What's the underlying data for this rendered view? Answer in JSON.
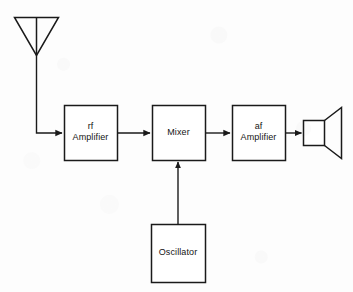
{
  "diagram": {
    "stroke_color": "#1a1a1a",
    "background_color": "#fdfdfd",
    "blocks": [
      {
        "id": "rf-amplifier",
        "label": "rf\nAmplifier",
        "x": 64,
        "y": 105,
        "w": 53,
        "h": 55
      },
      {
        "id": "mixer",
        "label": "Mixer",
        "x": 152,
        "y": 105,
        "w": 53,
        "h": 55
      },
      {
        "id": "af-amplifier",
        "label": "af\nAmplifier",
        "x": 232,
        "y": 105,
        "w": 53,
        "h": 55
      },
      {
        "id": "oscillator",
        "label": "Oscillator",
        "x": 151,
        "y": 224,
        "w": 54,
        "h": 58
      }
    ],
    "symbols": [
      {
        "id": "antenna",
        "name": "antenna-symbol",
        "label": ""
      },
      {
        "id": "speaker",
        "name": "loudspeaker-symbol",
        "label": ""
      }
    ],
    "connections": [
      {
        "id": "antenna-to-rf",
        "from": "antenna",
        "to": "rf-amplifier",
        "arrow": true
      },
      {
        "id": "rf-to-mixer",
        "from": "rf-amplifier",
        "to": "mixer",
        "arrow": true
      },
      {
        "id": "mixer-to-af",
        "from": "mixer",
        "to": "af-amplifier",
        "arrow": true
      },
      {
        "id": "af-to-speaker",
        "from": "af-amplifier",
        "to": "speaker",
        "arrow": true
      },
      {
        "id": "oscillator-to-mixer",
        "from": "oscillator",
        "to": "mixer",
        "arrow": true
      }
    ]
  }
}
